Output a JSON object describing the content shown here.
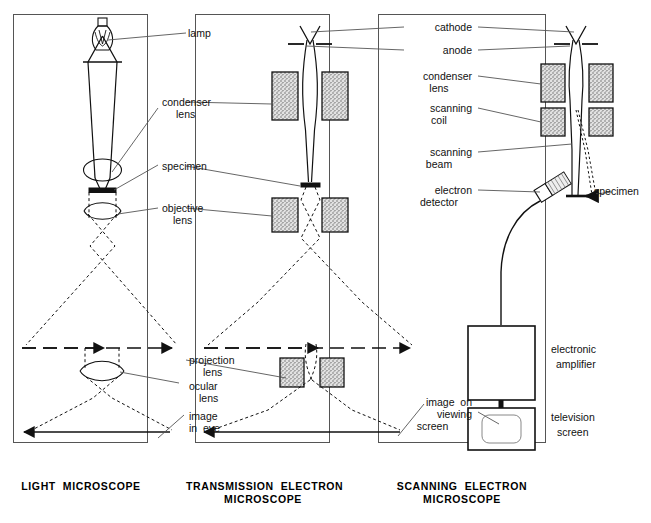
{
  "figure": {
    "type": "schematic-diagram",
    "panel_count": 3
  },
  "panels": [
    {
      "id": "light-microscope",
      "caption": "LIGHT  MICROSCOPE",
      "caption_lines": [
        "LIGHT  MICROSCOPE"
      ],
      "components": [
        "lamp",
        "condenser lens",
        "specimen",
        "objective lens",
        "projection lens",
        "ocular lens",
        "image in eye"
      ]
    },
    {
      "id": "transmission-electron-microscope",
      "caption": "TRANSMISSION  ELECTRON\nMICROSCOPE",
      "caption_lines": [
        "TRANSMISSION  ELECTRON",
        "MICROSCOPE"
      ],
      "components": [
        "cathode",
        "anode",
        "condenser lens",
        "specimen",
        "objective lens",
        "projection lens",
        "image on viewing screen"
      ]
    },
    {
      "id": "scanning-electron-microscope",
      "caption": "SCANNING  ELECTRON\nMICROSCOPE",
      "caption_lines": [
        "SCANNING  ELECTRON",
        "MICROSCOPE"
      ],
      "components": [
        "cathode",
        "anode",
        "condenser lens",
        "scanning coil",
        "scanning beam",
        "electron detector",
        "specimen",
        "electronic amplifier",
        "television screen",
        "image on viewing screen"
      ]
    }
  ],
  "labels": {
    "col_left": [
      {
        "key": "lamp",
        "text": "lamp",
        "align": "left"
      },
      {
        "key": "condenser_lens",
        "text": "condenser\nlens",
        "lines": [
          "condenser",
          "lens"
        ],
        "align": "left"
      },
      {
        "key": "specimen",
        "text": "specimen",
        "align": "left"
      },
      {
        "key": "objective_lens",
        "text": "objective\nlens",
        "lines": [
          "objective",
          "lens"
        ],
        "align": "left"
      },
      {
        "key": "projection_lens",
        "text": "projection\nlens",
        "lines": [
          "projection",
          "lens"
        ],
        "align": "left"
      },
      {
        "key": "ocular_lens",
        "text": "ocular\nlens",
        "lines": [
          "ocular",
          "lens"
        ],
        "align": "left"
      },
      {
        "key": "image_in_eye",
        "text": "image\nin  eye",
        "lines": [
          "image",
          "in  eye"
        ],
        "align": "left"
      }
    ],
    "col_right": [
      {
        "key": "cathode",
        "text": "cathode",
        "align": "right"
      },
      {
        "key": "anode",
        "text": "anode",
        "align": "right"
      },
      {
        "key": "condenser_lens",
        "text": "condenser\nlens",
        "lines": [
          "condenser",
          "lens"
        ],
        "align": "right"
      },
      {
        "key": "scanning_coil",
        "text": "scanning\ncoil",
        "lines": [
          "scanning",
          "coil"
        ],
        "align": "right"
      },
      {
        "key": "scanning_beam",
        "text": "scanning\nbeam",
        "lines": [
          "scanning",
          "beam"
        ],
        "align": "right"
      },
      {
        "key": "electron_detector",
        "text": "electron\ndetector",
        "lines": [
          "electron",
          "detector"
        ],
        "align": "right"
      },
      {
        "key": "image_on_viewing_screen",
        "text": "image  on\nviewing\nscreen",
        "lines": [
          "image  on",
          "viewing",
          "screen"
        ],
        "align": "right"
      }
    ],
    "inline": [
      {
        "key": "specimen_sem",
        "text": "specimen",
        "align": "left"
      },
      {
        "key": "electronic_amplifier",
        "text": "electronic\namplifier",
        "lines": [
          "electronic",
          "amplifier"
        ],
        "align": "left"
      },
      {
        "key": "television_screen",
        "text": "television\nscreen",
        "lines": [
          "television",
          "screen"
        ],
        "align": "left"
      }
    ]
  },
  "label_text": {
    "lamp": "lamp",
    "condenser_lens_1": "condenser",
    "condenser_lens_2": "lens",
    "specimen": "specimen",
    "objective_lens_1": "objective",
    "objective_lens_2": "lens",
    "projection_lens_1": "projection",
    "projection_lens_2": "lens",
    "ocular_lens_1": "ocular",
    "ocular_lens_2": "lens",
    "image_in_eye_1": "image",
    "image_in_eye_2": "in  eye",
    "cathode": "cathode",
    "anode": "anode",
    "condenser_lens_r1": "condenser",
    "condenser_lens_r2": "lens",
    "scanning_coil_1": "scanning",
    "scanning_coil_2": "coil",
    "scanning_beam_1": "scanning",
    "scanning_beam_2": "beam",
    "electron_detector_1": "electron",
    "electron_detector_2": "detector",
    "specimen_sem": "specimen",
    "image_on_viewing_1": "image  on",
    "image_on_viewing_2": "viewing",
    "image_on_viewing_3": "screen",
    "electronic_amplifier_1": "electronic",
    "electronic_amplifier_2": "amplifier",
    "television_screen_1": "television",
    "television_screen_2": "screen"
  },
  "captions": {
    "light": "LIGHT  MICROSCOPE",
    "tem_1": "TRANSMISSION  ELECTRON",
    "tem_2": "MICROSCOPE",
    "sem_1": "SCANNING  ELECTRON",
    "sem_2": "MICROSCOPE"
  },
  "colors": {
    "ink": "#111111",
    "frame": "#555555",
    "lens_fill": "#d8d8d8",
    "background": "#ffffff"
  }
}
